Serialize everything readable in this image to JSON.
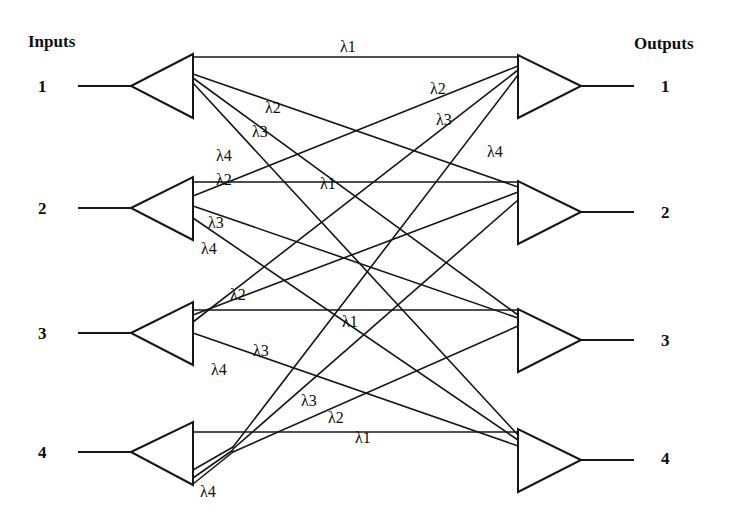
{
  "figure": {
    "title_left": "Inputs",
    "title_right": "Outputs",
    "background_color": "#ffffff",
    "line_color": "#161616"
  },
  "inputs": {
    "header": "Inputs",
    "ports": [
      {
        "label": "1"
      },
      {
        "label": "2"
      },
      {
        "label": "3"
      },
      {
        "label": "4"
      }
    ]
  },
  "outputs": {
    "header": "Outputs",
    "ports": [
      {
        "label": "1"
      },
      {
        "label": "2"
      },
      {
        "label": "3"
      },
      {
        "label": "4"
      }
    ]
  },
  "wavelength_labels": {
    "in1": [
      {
        "text": "λ1"
      },
      {
        "text": "λ2"
      },
      {
        "text": "λ3"
      },
      {
        "text": "λ4"
      }
    ],
    "in2": [
      {
        "text": "λ1"
      },
      {
        "text": "λ2"
      },
      {
        "text": "λ3"
      },
      {
        "text": "λ4"
      }
    ],
    "in3": [
      {
        "text": "λ1"
      },
      {
        "text": "λ2"
      },
      {
        "text": "λ3"
      },
      {
        "text": "λ4"
      }
    ],
    "in4": [
      {
        "text": "λ1"
      },
      {
        "text": "λ2"
      },
      {
        "text": "λ3"
      },
      {
        "text": "λ4"
      }
    ],
    "out1": [
      {
        "text": "λ2"
      },
      {
        "text": "λ3"
      },
      {
        "text": "λ4"
      }
    ]
  }
}
